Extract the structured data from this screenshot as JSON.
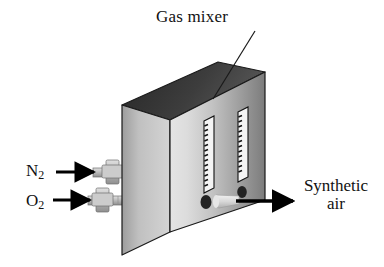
{
  "figure": {
    "device_name": "gas mixer",
    "background_color": "#ffffff"
  },
  "labels": {
    "gas_mixer": "Gas mixer",
    "nitrogen": "N",
    "nitrogen_sub": "2",
    "oxygen": "O",
    "oxygen_sub": "2",
    "synthetic_air_line1": "Synthetic",
    "synthetic_air_line2": "air"
  },
  "colors": {
    "top_face": "#3a3a3a",
    "left_face": "#b4b4b4",
    "front_face_light": "#dedede",
    "front_face_dark": "#7f7f7f",
    "outline": "#1a1a1a",
    "tube_fill": "#f2f2f2",
    "knob": "#2b2b2b",
    "nozzle": "#d0d0d0",
    "fitting": "#b9b9b9",
    "arrow": "#000000",
    "text": "#111111"
  },
  "geometry": {
    "box_front_top_left_x": 170,
    "box_front_top_left_y": 120,
    "box_front_right_x": 265,
    "box_front_top_right_y": 72,
    "box_front_bottom_y": 232,
    "box_left_face_x": 122,
    "box_left_face_top_y": 105,
    "box_left_face_bottom_y": 255
  },
  "parts": {
    "flow_tubes": [
      {
        "name": "flow-tube-left",
        "x": 205,
        "y_top": 118,
        "y_bottom": 190,
        "width": 8,
        "graduations": 15
      },
      {
        "name": "flow-tube-right",
        "x": 238,
        "y_top": 110,
        "y_bottom": 180,
        "width": 8,
        "graduations": 15
      }
    ],
    "knobs": [
      {
        "name": "flow-knob-left",
        "cx": 206,
        "cy": 201,
        "rx": 6,
        "ry": 7
      },
      {
        "name": "flow-knob-right",
        "cx": 242,
        "cy": 192,
        "rx": 5,
        "ry": 6
      }
    ],
    "inlet_fittings": [
      {
        "name": "inlet-fitting-nitrogen",
        "y": 178,
        "label": "N2"
      },
      {
        "name": "inlet-fitting-oxygen",
        "y": 202,
        "label": "O2"
      }
    ],
    "outlet_nozzle": {
      "name": "outlet-nozzle",
      "x": 221,
      "y": 201
    },
    "arrows": [
      {
        "name": "arrow-nitrogen-inlet",
        "x1": 56,
        "y1": 172,
        "x2": 92,
        "y2": 172
      },
      {
        "name": "arrow-oxygen-inlet",
        "x1": 53,
        "y1": 200,
        "x2": 88,
        "y2": 200
      },
      {
        "name": "arrow-synthetic-air-outlet",
        "x1": 241,
        "y1": 201,
        "x2": 292,
        "y2": 201
      }
    ],
    "leader_line": {
      "name": "gas-mixer-leader-line",
      "x1": 253,
      "y1": 33,
      "x2": 214,
      "y2": 98
    }
  }
}
